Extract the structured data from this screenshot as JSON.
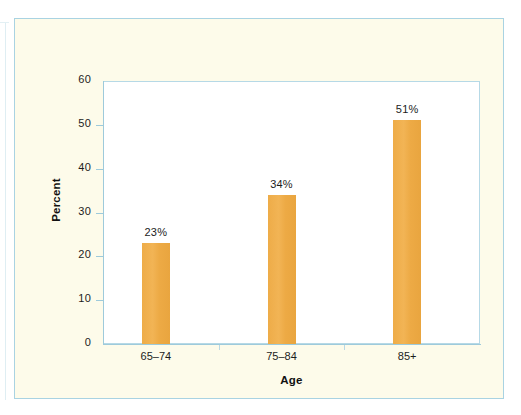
{
  "figure": {
    "background_color": "#FDFBEA",
    "border_color": "#A9D3E2",
    "plot_background_color": "#FFFFFF",
    "bar_color": "#EFAE4C"
  },
  "chart_data": {
    "type": "bar",
    "title": "",
    "subtitle": "",
    "categories": [
      "65–74",
      "75–84",
      "85+"
    ],
    "values": [
      23,
      34,
      51
    ],
    "data_labels": [
      "23%",
      "34%",
      "51%"
    ],
    "xlabel": "Age",
    "ylabel": "Percent",
    "ylim": [
      0,
      60
    ],
    "ytick_labels": [
      "0",
      "10",
      "20",
      "30",
      "40",
      "50",
      "60"
    ],
    "ytick_values": [
      0,
      10,
      20,
      30,
      40,
      50,
      60
    ],
    "grid": false,
    "legend": null,
    "legend_position": "none",
    "series": [
      {
        "name": "Percent",
        "values": [
          23,
          34,
          51
        ],
        "color": "#EFAE4C"
      }
    ]
  }
}
